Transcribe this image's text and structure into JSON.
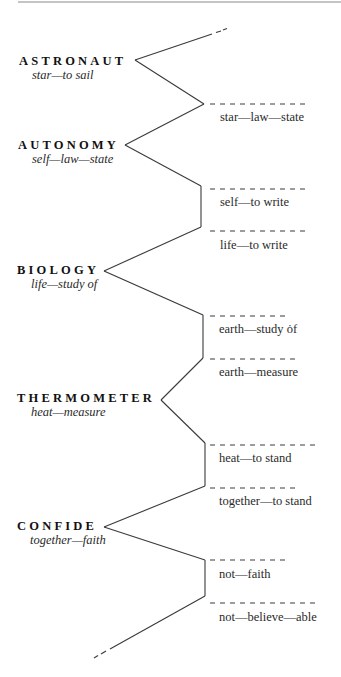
{
  "colors": {
    "line": "#3a3a3a",
    "text": "#1a1a1a",
    "background": "#ffffff"
  },
  "words": [
    {
      "word": "ASTRONAUT",
      "gloss": "star—to sail"
    },
    {
      "word": "AUTONOMY",
      "gloss": "self—law—state"
    },
    {
      "word": "BIOLOGY",
      "gloss": "life—study of"
    },
    {
      "word": "THERMOMETER",
      "gloss": "heat—measure"
    },
    {
      "word": "CONFIDE",
      "gloss": "together—faith"
    }
  ],
  "branches": [
    "star—law—state",
    "self—to write",
    "life—to write",
    "earth—study ȯf",
    "earth—measure",
    "heat—to stand",
    "together—to stand",
    "not—faith",
    "not—believe—able"
  ]
}
